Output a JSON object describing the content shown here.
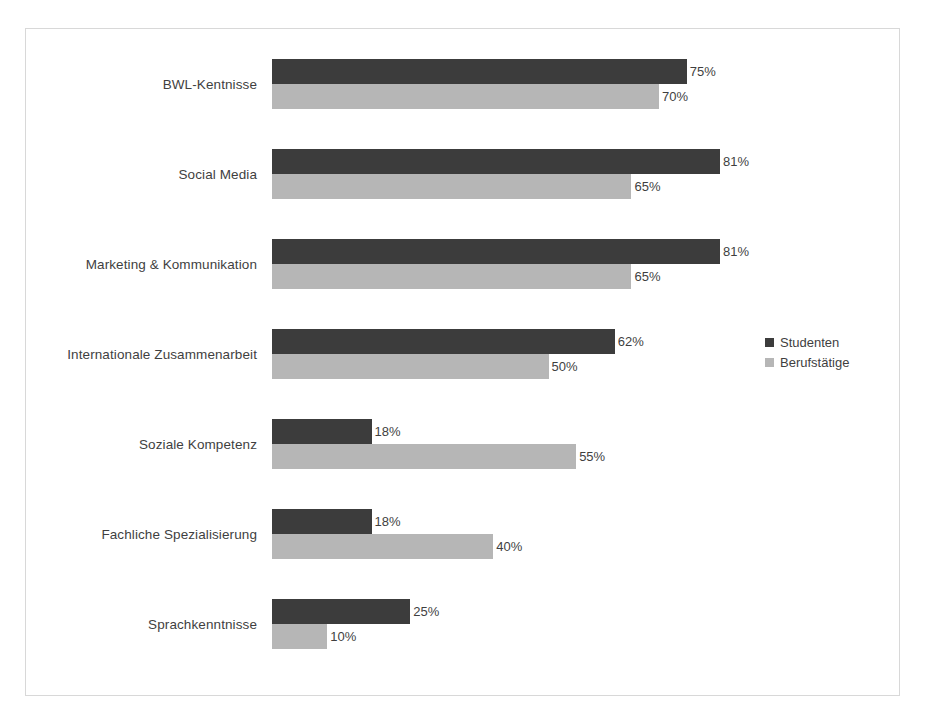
{
  "chart_data": {
    "type": "bar",
    "orientation": "horizontal",
    "title": "",
    "subtitle": "",
    "xlabel": "",
    "ylabel": "",
    "xlim": [
      0,
      100
    ],
    "grid": false,
    "value_suffix": "%",
    "legend_position": "right-middle",
    "categories": [
      "BWL-Kentnisse",
      "Social Media",
      "Marketing & Kommunikation",
      "Internationale Zusammenarbeit",
      "Soziale Kompetenz",
      "Fachliche Spezialisierung",
      "Sprachkenntnisse"
    ],
    "series": [
      {
        "name": "Studenten",
        "color": "#3c3c3c",
        "values": [
          75,
          81,
          81,
          62,
          18,
          18,
          25
        ],
        "labels": [
          "75%",
          "81%",
          "81%",
          "62%",
          "18%",
          "18%",
          "25%"
        ]
      },
      {
        "name": "Berufstätige",
        "color": "#b6b6b6",
        "values": [
          70,
          65,
          65,
          50,
          55,
          40,
          10
        ],
        "labels": [
          "70%",
          "65%",
          "65%",
          "50%",
          "55%",
          "40%",
          "10%"
        ]
      }
    ]
  },
  "legend": {
    "items": [
      {
        "label": "Studenten",
        "swatch": "dark"
      },
      {
        "label": "Berufstätige",
        "swatch": "light"
      }
    ]
  },
  "frame": {
    "border_color": "#d8d8d8",
    "background": "#ffffff"
  }
}
